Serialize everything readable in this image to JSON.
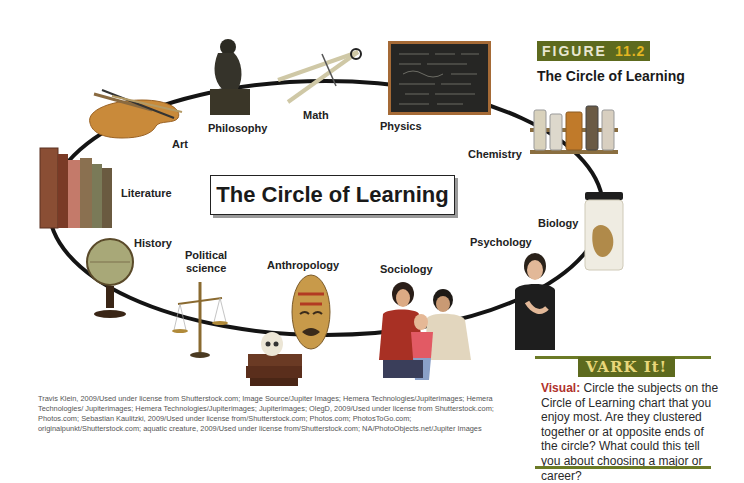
{
  "figure": {
    "banner_word": "FIGURE",
    "banner_number": "11.2",
    "title": "The Circle of Learning",
    "colors": {
      "banner_bg": "#5d6a1e",
      "banner_number": "#e2b622",
      "accent_red": "#b0322c"
    }
  },
  "diagram": {
    "center_title": "The Circle of Learning",
    "subjects": [
      {
        "label": "Art",
        "icon": "palette-icon"
      },
      {
        "label": "Philosophy",
        "icon": "thinker-statue-icon"
      },
      {
        "label": "Math",
        "icon": "compass-icon"
      },
      {
        "label": "Physics",
        "icon": "chalkboard-icon"
      },
      {
        "label": "Chemistry",
        "icon": "chemical-bottles-icon"
      },
      {
        "label": "Biology",
        "icon": "specimen-jar-frog-icon"
      },
      {
        "label": "Psychology",
        "icon": "thinking-woman-icon"
      },
      {
        "label": "Sociology",
        "icon": "family-icon"
      },
      {
        "label": "Anthropology",
        "icon": "tribal-mask-icon"
      },
      {
        "label_line1": "Political",
        "label_line2": "science",
        "icon": "scales-icon"
      },
      {
        "label": "History",
        "icon": "globe-icon"
      },
      {
        "label": "Literature",
        "icon": "books-icon"
      }
    ],
    "extra_icons": [
      "skull-on-books-icon"
    ]
  },
  "vark": {
    "header": "VARK It!",
    "lead": "Visual:",
    "text": " Circle the subjects on the Circle of Learning chart that you enjoy most. Are they clustered together or at opposite ends of the circle? What could this tell you about choosing a major or career?"
  },
  "credits": "Travis Klein, 2009/Used under license from Shutterstock.com; Image Source/Jupiter Images; Hemera Technologies/Jupiterimages; Hemera Technologies/ Jupiterimages; Hemera Technologies/Jupiterimages; Jupiterimages; OlegD, 2009/Used under license from Shutterstock.com; Photos.com; Sebastian Kaulitzki, 2009/Used under license from/Shutterstock.com; Photos.com; PhotosToGo.com; originalpunkt/Shutterstock.com; aquatic creature, 2009/Used under license from/Shutterstock.com; NA/PhotoObjects.net/Jupiter Images"
}
